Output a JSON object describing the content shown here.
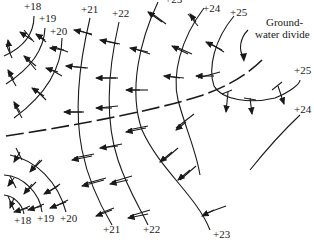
{
  "diagram": {
    "type": "potentiometric-map",
    "annotation": {
      "line1": "Ground-",
      "line2": "water divide"
    },
    "top_labels": [
      "+18",
      "+19",
      "+20",
      "+21",
      "+22",
      "+23",
      "+24",
      "+25"
    ],
    "right_labels": [
      "+25",
      "+24"
    ],
    "bottom_labels": [
      "+18",
      "+19",
      "+20",
      "+21",
      "+22",
      "+23"
    ],
    "contours_north": [
      {
        "value": "+18",
        "label": "+18"
      },
      {
        "value": "+19",
        "label": "+19"
      },
      {
        "value": "+20",
        "label": "+20"
      },
      {
        "value": "+21",
        "label": "+21"
      },
      {
        "value": "+22",
        "label": "+22"
      },
      {
        "value": "+23",
        "label": "+23"
      },
      {
        "value": "+24",
        "label": "+24"
      },
      {
        "value": "+25",
        "label": "+25"
      }
    ],
    "contours_south": [
      {
        "value": "+18",
        "label": "+18"
      },
      {
        "value": "+19",
        "label": "+19"
      },
      {
        "value": "+20",
        "label": "+20"
      },
      {
        "value": "+21",
        "label": "+21"
      },
      {
        "value": "+22",
        "label": "+22"
      },
      {
        "value": "+23",
        "label": "+23"
      }
    ],
    "features": [
      "equipotential lines",
      "flow arrows perpendicular to contours",
      "dashed groundwater divide"
    ],
    "colors": {
      "ink": "#1a1a1a",
      "background": "#ffffff"
    }
  }
}
